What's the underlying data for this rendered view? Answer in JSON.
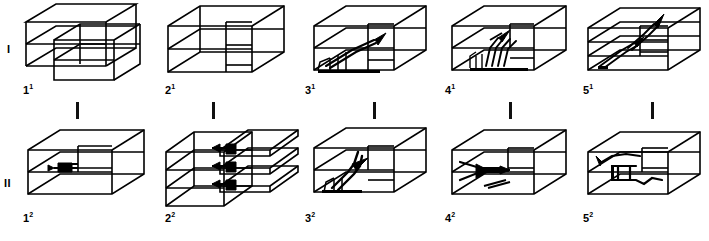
{
  "figure": {
    "background_color": "#ffffff",
    "line_color": "#000000",
    "rows": [
      {
        "id": "I",
        "row_label": "I",
        "cells": [
          {
            "label_base": "1",
            "label_sup": "1",
            "variant": "offset-blocks"
          },
          {
            "label_base": "2",
            "label_sup": "1",
            "variant": "layered-plain"
          },
          {
            "label_base": "3",
            "label_sup": "1",
            "variant": "thrust-ramp"
          },
          {
            "label_base": "4",
            "label_sup": "1",
            "variant": "fan-fold"
          },
          {
            "label_base": "5",
            "label_sup": "1",
            "variant": "three-layer-arrows"
          }
        ]
      },
      {
        "id": "II",
        "row_label": "II",
        "cells": [
          {
            "label_base": "1",
            "label_sup": "2",
            "variant": "single-seam"
          },
          {
            "label_base": "2",
            "label_sup": "2",
            "variant": "exploded-slabs"
          },
          {
            "label_base": "3",
            "label_sup": "2",
            "variant": "step-fault"
          },
          {
            "label_base": "4",
            "label_sup": "2",
            "variant": "wedge-fold"
          },
          {
            "label_base": "5",
            "label_sup": "2",
            "variant": "hook-fold"
          }
        ]
      }
    ],
    "separators": {
      "count": 5,
      "orientation": "vertical-tick"
    }
  }
}
